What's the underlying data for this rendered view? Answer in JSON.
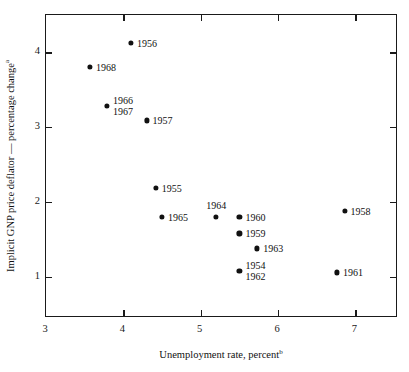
{
  "chart_data": {
    "type": "scatter",
    "title": "",
    "xlabel": "Unemployment rate, percent",
    "xlabel_superscript": "b",
    "ylabel": "Implicit GNP price deflator — percentage change",
    "ylabel_superscript": "a",
    "xlim": [
      3.0,
      7.55
    ],
    "ylim": [
      0.45,
      4.5
    ],
    "xticks": [
      3,
      4,
      5,
      6,
      7
    ],
    "xtick_labels": [
      "3",
      "4",
      "5",
      "6",
      "7"
    ],
    "yticks": [
      1,
      2,
      3,
      4
    ],
    "ytick_labels": [
      "1",
      "2",
      "3",
      "4"
    ],
    "grid": false,
    "legend": "none",
    "marker_color": "#111111",
    "axis_color": "#1a1a1a",
    "points": [
      {
        "label": "1956",
        "x": 4.1,
        "y": 4.13,
        "label_pos": "right"
      },
      {
        "label": "1968",
        "x": 3.57,
        "y": 3.81,
        "label_pos": "right"
      },
      {
        "label": "1966\n1967",
        "x": 3.79,
        "y": 3.28,
        "label_pos": "right-two-line"
      },
      {
        "label": "1957",
        "x": 4.3,
        "y": 3.09,
        "label_pos": "right"
      },
      {
        "label": "1955",
        "x": 4.42,
        "y": 2.19,
        "label_pos": "right"
      },
      {
        "label": "1965",
        "x": 4.5,
        "y": 1.8,
        "label_pos": "right"
      },
      {
        "label": "1964",
        "x": 5.2,
        "y": 1.8,
        "label_pos": "above"
      },
      {
        "label": "1960",
        "x": 5.5,
        "y": 1.8,
        "label_pos": "right"
      },
      {
        "label": "1959",
        "x": 5.5,
        "y": 1.58,
        "label_pos": "right"
      },
      {
        "label": "1963",
        "x": 5.73,
        "y": 1.38,
        "label_pos": "right"
      },
      {
        "label": "1954\n1962",
        "x": 5.5,
        "y": 1.08,
        "label_pos": "right-two-line"
      },
      {
        "label": "1958",
        "x": 6.86,
        "y": 1.88,
        "label_pos": "right"
      },
      {
        "label": "1961",
        "x": 6.76,
        "y": 1.06,
        "label_pos": "right"
      }
    ]
  }
}
